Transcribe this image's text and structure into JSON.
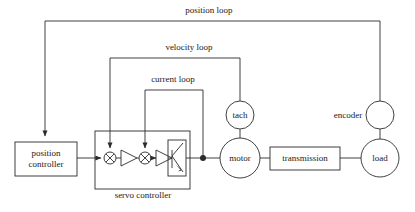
{
  "diagram": {
    "stroke_color": "#2b2b2b",
    "text_color": "#1a1a1a",
    "background": "#ffffff"
  },
  "loops": [
    {
      "id": "position-loop",
      "label": "position loop",
      "label_x": 208,
      "label_y": 11,
      "from": "encoder",
      "to": "position controller"
    },
    {
      "id": "velocity-loop",
      "label": "velocity loop",
      "label_x": 188,
      "label_y": 48,
      "from": "tach",
      "to": "first summing junction"
    },
    {
      "id": "current-loop",
      "label": "current loop",
      "label_x": 172,
      "label_y": 80,
      "from": "motor current node",
      "to": "second summing junction"
    }
  ],
  "blocks": [
    {
      "id": "position-controller",
      "shape": "rect",
      "line1": "position",
      "line2": "controller",
      "x": 15,
      "y": 142,
      "w": 62,
      "h": 34
    },
    {
      "id": "servo-controller",
      "shape": "rect-container",
      "label": "servo controller",
      "x": 95,
      "y": 131,
      "w": 95,
      "h": 58,
      "label_x": 142,
      "label_y": 192
    },
    {
      "id": "transmission",
      "shape": "rect",
      "label": "transmission",
      "x": 270,
      "y": 147,
      "w": 70,
      "h": 23
    }
  ],
  "nodes": [
    {
      "id": "tach",
      "shape": "circle",
      "label": "tach",
      "cx": 240,
      "cy": 115,
      "r": 14,
      "label_inside": true
    },
    {
      "id": "motor",
      "shape": "circle",
      "label": "motor",
      "cx": 240,
      "cy": 158,
      "r": 20,
      "label_inside": true
    },
    {
      "id": "encoder",
      "shape": "circle",
      "label": "encoder",
      "cx": 380,
      "cy": 115,
      "r": 14,
      "label_inside": false,
      "label_x": 348,
      "label_y": 111
    },
    {
      "id": "load",
      "shape": "circle",
      "label": "load",
      "cx": 380,
      "cy": 158,
      "r": 19,
      "label_inside": true
    }
  ],
  "servo_internals": [
    {
      "id": "summing-junction-1",
      "shape": "circle-x",
      "cx": 110,
      "cy": 158,
      "r": 6
    },
    {
      "id": "amplifier-1",
      "shape": "triangle",
      "x": 121,
      "y": 150,
      "w": 16,
      "h": 16
    },
    {
      "id": "summing-junction-2",
      "shape": "circle-x",
      "cx": 145,
      "cy": 158,
      "r": 6
    },
    {
      "id": "amplifier-2",
      "shape": "triangle",
      "x": 156,
      "y": 150,
      "w": 16,
      "h": 16
    },
    {
      "id": "power-stage",
      "shape": "rect-transistor",
      "x": 168,
      "y": 140,
      "w": 18,
      "h": 36
    }
  ],
  "junction_dots": [
    {
      "id": "motor-current-node",
      "cx": 203,
      "cy": 158,
      "r": 3
    }
  ]
}
